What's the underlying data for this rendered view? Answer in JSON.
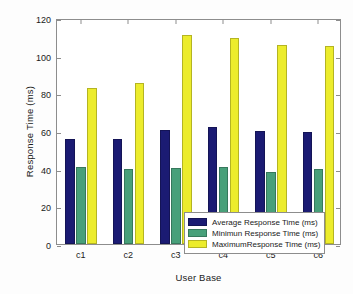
{
  "chart_data": {
    "type": "bar",
    "title": "",
    "xlabel": "User Base",
    "ylabel": "Response Time (ms)",
    "categories": [
      "c1",
      "c2",
      "c3",
      "c4",
      "c5",
      "c6"
    ],
    "series": [
      {
        "name": "Average Response Time (ms)",
        "color": "#1b1b73",
        "values": [
          55.8,
          56.0,
          60.6,
          62.0,
          60.2,
          59.6
        ]
      },
      {
        "name": "Minimun Response Time (ms)",
        "color": "#48a07a",
        "values": [
          40.8,
          39.9,
          40.6,
          40.7,
          38.0,
          39.9
        ]
      },
      {
        "name": "MaximumResponse Time (ms)",
        "color": "#ecec2c",
        "values": [
          82.9,
          85.6,
          111.2,
          109.3,
          105.9,
          105.1
        ]
      }
    ],
    "ylim": [
      0,
      120
    ],
    "yticks": [
      0,
      20,
      40,
      60,
      80,
      100,
      120
    ],
    "grid": false,
    "legend_position": "center-bottom-right"
  },
  "legend": {
    "items": [
      {
        "label": "Average Response Time (ms)",
        "swatch": "avg"
      },
      {
        "label": "Minimun Response Time (ms)",
        "swatch": "min"
      },
      {
        "label": "MaximumResponse Time (ms)",
        "swatch": "max"
      }
    ]
  }
}
